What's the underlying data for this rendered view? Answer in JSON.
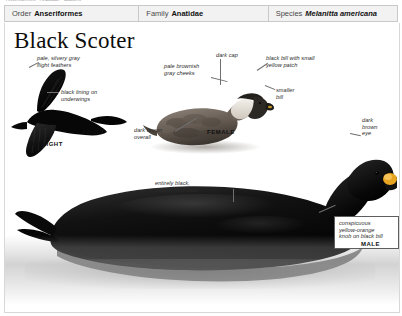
{
  "page": {
    "clipped_header_text": "Anseriformes • Anatidae • Scoters",
    "background_color": "#ffffff"
  },
  "taxonomy": {
    "columns": [
      {
        "key": "Order",
        "value": "Anseriformes",
        "italic": false
      },
      {
        "key": "Family",
        "value": "Anatidae",
        "italic": false
      },
      {
        "key": "Species",
        "value": "Melanitta americana",
        "italic": true
      }
    ]
  },
  "species": {
    "common_name": "Black Scoter"
  },
  "annotations": {
    "flight_feathers": "pale, silvery gray\nflight feathers",
    "underwing_lining": "black lining on\nunderwings",
    "dark_cap": "dark cap",
    "cheeks": "pale brownish\ngray cheeks",
    "female_bill": "black bill with small\nyellow patch",
    "smaller_bill": "smaller\nbill",
    "female_overall": "dark brown\noverall",
    "male_eye": "dark\nbrown\neye",
    "male_body": "entirely black,\nheavily built body",
    "knob_callout": "conspicuous\nyellow-orange\nknob on black bill"
  },
  "stage_labels": {
    "adult": "ADULT",
    "in_flight": "IN FLIGHT",
    "female": "FEMALE",
    "male": "MALE"
  },
  "colors": {
    "plate_border": "#d8d8d8",
    "header_fill": "#f2f2f2",
    "header_border": "#c9c9c9",
    "leader_line": "#6f6f6f",
    "bird_black": "#0b0b0b",
    "female_brown": "#6e6257",
    "knob_yellow_orange": "#e8a521",
    "water_gray": "#9a9a9a"
  }
}
